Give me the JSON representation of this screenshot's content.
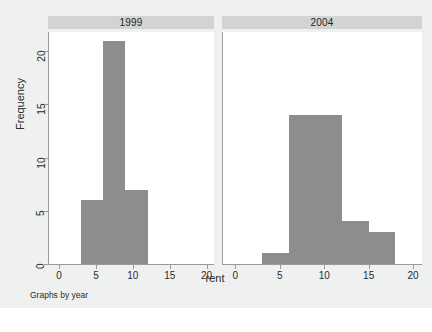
{
  "chart_data": {
    "type": "bar",
    "title": "",
    "subtitle": "",
    "xlabel": "rent",
    "ylabel": "Frequency",
    "note": "Graphs by year",
    "grid": false,
    "legend_position": "none",
    "faceted": true,
    "facet_variable": "year",
    "xlim": [
      -1.5,
      21
    ],
    "ylim": [
      0,
      21.8
    ],
    "xticks": [
      0,
      5,
      10,
      15,
      20
    ],
    "yticks": [
      0,
      5,
      10,
      15,
      20
    ],
    "bin_width": 3,
    "bar_color": "#8d8d8d",
    "panel_header_color": "#d3d3d3",
    "background_color": "#eff0f0",
    "plot_background_color": "#ffffff",
    "axis_color": "#9a9a9a",
    "panels": [
      {
        "label": "1999",
        "bins": [
          {
            "x0": 3,
            "x1": 6,
            "frequency": 6
          },
          {
            "x0": 6,
            "x1": 9,
            "frequency": 21
          },
          {
            "x0": 9,
            "x1": 12,
            "frequency": 7
          }
        ]
      },
      {
        "label": "2004",
        "bins": [
          {
            "x0": 3,
            "x1": 6,
            "frequency": 1
          },
          {
            "x0": 6,
            "x1": 9,
            "frequency": 14
          },
          {
            "x0": 9,
            "x1": 12,
            "frequency": 14
          },
          {
            "x0": 12,
            "x1": 15,
            "frequency": 4
          },
          {
            "x0": 15,
            "x1": 18,
            "frequency": 3
          }
        ]
      }
    ]
  }
}
